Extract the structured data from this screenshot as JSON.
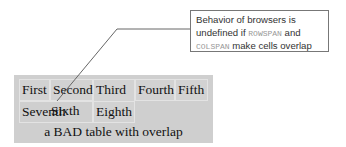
{
  "callout": {
    "line1": "Behavior of browsers is",
    "line2_pre": "undefined if ",
    "line2_code": "ROWSPAN",
    "line2_post": " and",
    "line3_code": "COLSPAN",
    "line3_post": " make cells overlap"
  },
  "table": {
    "row1": [
      "First",
      "Second",
      "Third",
      "Fourth",
      "Fifth"
    ],
    "row2": [
      "Seventh",
      "Sixth",
      "Eighth"
    ],
    "caption": "a BAD table with overlap"
  }
}
